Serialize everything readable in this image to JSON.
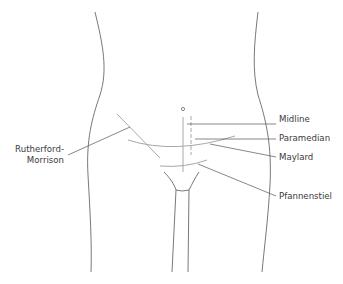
{
  "diagram": {
    "colors": {
      "outline": "#555555",
      "incision": "#a8a8a8",
      "leader": "#555555",
      "text": "#3a3a3a",
      "background": "#ffffff"
    },
    "labels": {
      "midline": "Midline",
      "paramedian": "Paramedian",
      "maylard": "Maylard",
      "pfannenstiel": "Pfannenstiel",
      "rutherford_line1": "Rutherford-",
      "rutherford_line2": "Morrison"
    },
    "umbilicus_symbol": "o"
  }
}
